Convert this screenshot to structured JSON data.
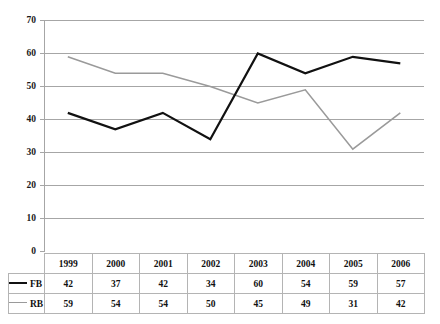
{
  "chart_data": {
    "type": "line",
    "title": "",
    "xlabel": "",
    "ylabel": "",
    "categories": [
      "1999",
      "2000",
      "2001",
      "2002",
      "2003",
      "2004",
      "2005",
      "2006"
    ],
    "series": [
      {
        "name": "FB",
        "values": [
          42,
          37,
          42,
          34,
          60,
          54,
          59,
          57
        ],
        "color": "#111111"
      },
      {
        "name": "RB",
        "values": [
          59,
          54,
          54,
          50,
          45,
          49,
          31,
          42
        ],
        "color": "#9a9a9a"
      }
    ],
    "ylim": [
      0,
      70
    ],
    "yticks": [
      0,
      10,
      20,
      30,
      40,
      50,
      60,
      70
    ],
    "ytick_labels": [
      "0",
      "10",
      "20",
      "30",
      "40",
      "50",
      "60",
      "70"
    ],
    "grid": true,
    "grid_axis": "y",
    "legend_position": "table-left",
    "data_table_visible": true
  },
  "axis": {
    "y_labels": [
      "70",
      "60",
      "50",
      "40",
      "30",
      "20",
      "10",
      "0"
    ]
  },
  "table": {
    "header": [
      "1999",
      "2000",
      "2001",
      "2002",
      "2003",
      "2004",
      "2005",
      "2006"
    ],
    "rows": [
      {
        "label": "FB",
        "values": [
          "42",
          "37",
          "42",
          "34",
          "60",
          "54",
          "59",
          "57"
        ]
      },
      {
        "label": "RB",
        "values": [
          "59",
          "54",
          "54",
          "50",
          "45",
          "49",
          "31",
          "42"
        ]
      }
    ]
  },
  "colors": {
    "series_fb": "#111111",
    "series_rb": "#9a9a9a",
    "gridline": "#a6a6a6",
    "table_border": "#b4b4b4"
  }
}
